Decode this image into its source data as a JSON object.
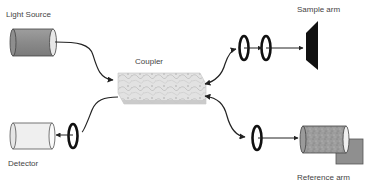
{
  "components": {
    "light_source": {
      "label": "Light Source"
    },
    "coupler": {
      "label": "Coupler"
    },
    "sample_arm": {
      "label": "Sample arm"
    },
    "reference_arm": {
      "label": "Reference arm"
    },
    "detector": {
      "label": "Detector"
    }
  },
  "colors": {
    "fiber": "#222222",
    "lens": "#111111",
    "light_source_body": "#8c8c8c",
    "detector_body": "#efefef",
    "reference_body": "#9a9a9a",
    "reference_mirror": "#8f8f8f",
    "sample": "#111111",
    "coupler": "#dcdcdc"
  }
}
